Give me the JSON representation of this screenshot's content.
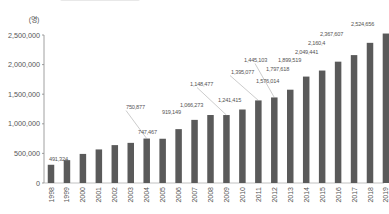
{
  "chart_data": {
    "type": "bar",
    "title": "",
    "unit_label": "(명)",
    "xlabel": "",
    "ylabel": "(명)",
    "ylim": [
      0,
      2500000
    ],
    "yticks": [
      0,
      500000,
      1000000,
      1500000,
      2000000,
      2500000
    ],
    "ytick_labels": [
      "0",
      "500,000",
      "1,000,000",
      "1,500,000",
      "2,000,000",
      "2,500,000"
    ],
    "grid": false,
    "legend": null,
    "bar_color": "#5a5a5a",
    "categories": [
      "1998",
      "1999",
      "2000",
      "2001",
      "2002",
      "2003",
      "2004",
      "2005",
      "2006",
      "2007",
      "2008",
      "2009",
      "2010",
      "2011",
      "2012",
      "2013",
      "2014",
      "2015",
      "2016",
      "2017",
      "2018",
      "2019"
    ],
    "values": [
      308000,
      386000,
      491324,
      567000,
      640000,
      678000,
      750877,
      747467,
      910000,
      1066273,
      1148477,
      1148000,
      1241415,
      1395077,
      1445103,
      1576014,
      1797618,
      1899519,
      2049441,
      2160400,
      2367607,
      2524656
    ],
    "data_labels": [
      {
        "year": "1998",
        "text": "491,324"
      },
      {
        "year": "2004",
        "text": "750,877"
      },
      {
        "year": "2005",
        "text": "747,467"
      },
      {
        "year": "2007",
        "text": "919,149"
      },
      {
        "year": "2008",
        "text": "1,066,273"
      },
      {
        "year": "2009",
        "text": "1,148,477"
      },
      {
        "year": "2010",
        "text": "1,241,415"
      },
      {
        "year": "2011",
        "text": "1,395,077"
      },
      {
        "year": "2012",
        "text": "1,445,103"
      },
      {
        "year": "2013",
        "text": "1,576,014"
      },
      {
        "year": "2014",
        "text": "1,797,618"
      },
      {
        "year": "2015",
        "text": "1,899,519"
      },
      {
        "year": "2016",
        "text": "2,049,441"
      },
      {
        "year": "2017",
        "text": "2,160,4"
      },
      {
        "year": "2018",
        "text": "2,367,607"
      },
      {
        "year": "2019",
        "text": "2,524,656"
      }
    ]
  }
}
